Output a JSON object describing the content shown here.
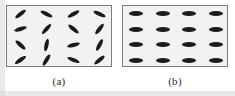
{
  "figure": {
    "background_color": "#ffffff",
    "panel_fill_color": "#f3f2f0",
    "panel_border_color": "#7d7d7d",
    "element_color": "#1a1a1a"
  },
  "panels": [
    {
      "id": "a",
      "caption": "(a)",
      "description": "Array of elongated lozenge elements at mixed, irregular orientations",
      "rows": 4,
      "columns": 4,
      "element_length": 13,
      "element_thickness": 4,
      "elements": [
        {
          "row": 0,
          "col": 0,
          "angle": -38
        },
        {
          "row": 0,
          "col": 1,
          "angle": 26
        },
        {
          "row": 0,
          "col": 2,
          "angle": -30
        },
        {
          "row": 0,
          "col": 3,
          "angle": 24
        },
        {
          "row": 1,
          "col": 0,
          "angle": -16
        },
        {
          "row": 1,
          "col": 1,
          "angle": -48
        },
        {
          "row": 1,
          "col": 2,
          "angle": 40
        },
        {
          "row": 1,
          "col": 3,
          "angle": -52
        },
        {
          "row": 2,
          "col": 0,
          "angle": 42
        },
        {
          "row": 2,
          "col": 1,
          "angle": -78
        },
        {
          "row": 2,
          "col": 2,
          "angle": -14
        },
        {
          "row": 2,
          "col": 3,
          "angle": -62
        },
        {
          "row": 3,
          "col": 0,
          "angle": -34
        },
        {
          "row": 3,
          "col": 1,
          "angle": -58
        },
        {
          "row": 3,
          "col": 2,
          "angle": 22
        },
        {
          "row": 3,
          "col": 3,
          "angle": -40
        }
      ]
    },
    {
      "id": "b",
      "caption": "(b)",
      "description": "Array of elongated lozenge elements all at the same horizontal orientation",
      "rows": 4,
      "columns": 4,
      "element_length": 14,
      "element_thickness": 5,
      "elements": [
        {
          "row": 0,
          "col": 0,
          "angle": 0
        },
        {
          "row": 0,
          "col": 1,
          "angle": 0
        },
        {
          "row": 0,
          "col": 2,
          "angle": 0
        },
        {
          "row": 0,
          "col": 3,
          "angle": 0
        },
        {
          "row": 1,
          "col": 0,
          "angle": 0
        },
        {
          "row": 1,
          "col": 1,
          "angle": 0
        },
        {
          "row": 1,
          "col": 2,
          "angle": 0
        },
        {
          "row": 1,
          "col": 3,
          "angle": 0
        },
        {
          "row": 2,
          "col": 0,
          "angle": 0
        },
        {
          "row": 2,
          "col": 1,
          "angle": 0
        },
        {
          "row": 2,
          "col": 2,
          "angle": 0
        },
        {
          "row": 2,
          "col": 3,
          "angle": 0
        },
        {
          "row": 3,
          "col": 0,
          "angle": 0
        },
        {
          "row": 3,
          "col": 1,
          "angle": 0
        },
        {
          "row": 3,
          "col": 2,
          "angle": 0
        },
        {
          "row": 3,
          "col": 3,
          "angle": 0
        }
      ]
    }
  ]
}
